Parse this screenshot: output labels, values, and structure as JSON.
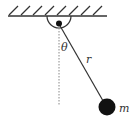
{
  "diagram": {
    "type": "simple-pendulum",
    "labels": {
      "angle": "θ",
      "length": "r",
      "mass": "m"
    },
    "colors": {
      "stroke": "#333333",
      "bob": "#111111",
      "dotted": "#888888",
      "background": "#ffffff"
    }
  }
}
